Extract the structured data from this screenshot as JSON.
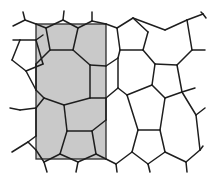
{
  "figure": {
    "shaded_region": {
      "x": 36,
      "y": 24,
      "width": 70,
      "height": 135,
      "fill": "#c9c9c9"
    },
    "line_color": "#1e1e1e",
    "background": "#ffffff",
    "edges": [
      [
        13,
        26,
        25,
        20
      ],
      [
        25,
        20,
        23,
        12
      ],
      [
        25,
        20,
        36,
        24
      ],
      [
        36,
        24,
        46,
        28
      ],
      [
        46,
        28,
        63,
        20
      ],
      [
        63,
        20,
        64,
        11
      ],
      [
        63,
        20,
        78,
        28
      ],
      [
        78,
        28,
        92,
        21
      ],
      [
        92,
        21,
        92,
        12
      ],
      [
        92,
        21,
        106,
        24
      ],
      [
        106,
        24,
        117,
        28
      ],
      [
        117,
        28,
        133,
        18
      ],
      [
        133,
        18,
        165,
        30
      ],
      [
        165,
        30,
        187,
        20
      ],
      [
        187,
        20,
        203,
        14
      ],
      [
        203,
        14,
        206,
        18
      ],
      [
        203,
        14,
        201,
        12
      ],
      [
        46,
        28,
        50,
        50
      ],
      [
        50,
        50,
        73,
        50
      ],
      [
        73,
        50,
        78,
        28
      ],
      [
        117,
        28,
        120,
        50
      ],
      [
        120,
        50,
        143,
        50
      ],
      [
        143,
        50,
        148,
        32
      ],
      [
        148,
        32,
        133,
        18
      ],
      [
        187,
        20,
        192,
        50
      ],
      [
        192,
        50,
        205,
        50
      ],
      [
        192,
        50,
        177,
        65
      ],
      [
        13,
        40,
        20,
        40
      ],
      [
        20,
        40,
        36,
        40
      ],
      [
        36,
        40,
        43,
        35
      ],
      [
        20,
        40,
        12,
        60
      ],
      [
        12,
        60,
        26,
        71
      ],
      [
        26,
        71,
        43,
        64
      ],
      [
        43,
        64,
        36,
        40
      ],
      [
        50,
        50,
        36,
        64
      ],
      [
        36,
        64,
        36,
        66
      ],
      [
        73,
        50,
        90,
        65
      ],
      [
        90,
        65,
        106,
        66
      ],
      [
        106,
        66,
        118,
        58
      ],
      [
        118,
        58,
        120,
        50
      ],
      [
        143,
        50,
        155,
        64
      ],
      [
        155,
        64,
        177,
        65
      ],
      [
        36,
        66,
        36,
        90
      ],
      [
        26,
        71,
        36,
        90
      ],
      [
        36,
        90,
        44,
        98
      ],
      [
        44,
        98,
        64,
        105
      ],
      [
        64,
        105,
        90,
        98
      ],
      [
        90,
        98,
        90,
        65
      ],
      [
        90,
        98,
        106,
        98
      ],
      [
        106,
        98,
        118,
        88
      ],
      [
        118,
        88,
        118,
        58
      ],
      [
        118,
        88,
        127,
        95
      ],
      [
        127,
        95,
        152,
        85
      ],
      [
        152,
        85,
        155,
        64
      ],
      [
        152,
        85,
        165,
        98
      ],
      [
        165,
        98,
        182,
        92
      ],
      [
        182,
        92,
        177,
        65
      ],
      [
        182,
        92,
        196,
        115
      ],
      [
        196,
        115,
        205,
        108
      ],
      [
        182,
        92,
        195,
        88
      ],
      [
        44,
        98,
        36,
        108
      ],
      [
        36,
        108,
        36,
        136
      ],
      [
        20,
        110,
        36,
        108
      ],
      [
        20,
        110,
        10,
        108
      ],
      [
        64,
        105,
        67,
        131
      ],
      [
        67,
        131,
        92,
        131
      ],
      [
        92,
        131,
        106,
        120
      ],
      [
        106,
        120,
        106,
        98
      ],
      [
        127,
        95,
        138,
        130
      ],
      [
        138,
        130,
        160,
        130
      ],
      [
        160,
        130,
        165,
        98
      ],
      [
        138,
        130,
        132,
        152
      ],
      [
        132,
        152,
        148,
        164
      ],
      [
        148,
        164,
        165,
        152
      ],
      [
        165,
        152,
        160,
        130
      ],
      [
        165,
        152,
        186,
        162
      ],
      [
        186,
        162,
        200,
        150
      ],
      [
        200,
        150,
        196,
        115
      ],
      [
        186,
        162,
        187,
        172
      ],
      [
        200,
        150,
        203,
        146
      ],
      [
        36,
        136,
        28,
        142
      ],
      [
        28,
        142,
        12,
        152
      ],
      [
        28,
        142,
        36,
        150
      ],
      [
        36,
        150,
        44,
        162
      ],
      [
        44,
        162,
        47,
        172
      ],
      [
        67,
        131,
        60,
        154
      ],
      [
        60,
        154,
        44,
        162
      ],
      [
        60,
        154,
        78,
        162
      ],
      [
        78,
        162,
        76,
        172
      ],
      [
        78,
        162,
        96,
        154
      ],
      [
        96,
        154,
        92,
        131
      ],
      [
        96,
        154,
        106,
        159
      ],
      [
        106,
        159,
        116,
        164
      ],
      [
        116,
        164,
        117,
        172
      ],
      [
        116,
        164,
        132,
        152
      ],
      [
        148,
        164,
        150,
        172
      ]
    ]
  }
}
